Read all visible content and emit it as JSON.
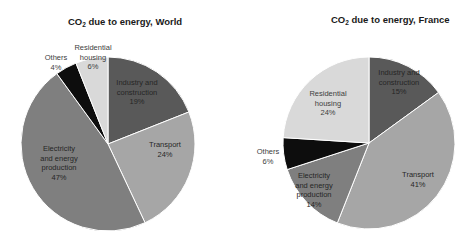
{
  "chart_data": [
    {
      "type": "pie",
      "title": "CO2 due to energy, World",
      "title_parts": {
        "prefix": "CO",
        "subscript": "2",
        "suffix": " due to energy, World"
      },
      "categories": [
        "Industry and construction",
        "Transport",
        "Electricity and energy production",
        "Others",
        "Residential housing"
      ],
      "values": [
        19,
        24,
        47,
        4,
        6
      ],
      "unit": "%",
      "start_angle": "12 o'clock",
      "direction": "clockwise",
      "colors": [
        "#595959",
        "#a6a6a6",
        "#7f7f7f",
        "#0d0d0d",
        "#d9d9d9"
      ],
      "labels": [
        {
          "lines": [
            "Industry and",
            "construction",
            "19%"
          ],
          "x": 137,
          "y": 92,
          "color": "#262626"
        },
        {
          "lines": [
            "Transport",
            "24%"
          ],
          "x": 165,
          "y": 149,
          "color": "#262626"
        },
        {
          "lines": [
            "Electricity",
            "and energy",
            "production",
            "47%"
          ],
          "x": 59,
          "y": 163,
          "color": "#262626"
        },
        {
          "lines": [
            "Others",
            "4%"
          ],
          "x": 56,
          "y": 62,
          "color": "#404040",
          "outside": true
        },
        {
          "lines": [
            "Residential",
            "housing",
            "6%"
          ],
          "x": 93,
          "y": 57,
          "color": "#404040",
          "outside": true
        }
      ],
      "legend": "none"
    },
    {
      "type": "pie",
      "title": "CO2 due to energy, France",
      "title_parts": {
        "prefix": "CO",
        "subscript": "2",
        "suffix": " due to energy, France"
      },
      "categories": [
        "Industry and construction",
        "Transport",
        "Electricity and energy production",
        "Others",
        "Residential housing"
      ],
      "values": [
        15,
        41,
        14,
        6,
        24
      ],
      "unit": "%",
      "start_angle": "12 o'clock",
      "direction": "clockwise",
      "colors": [
        "#595959",
        "#a6a6a6",
        "#7f7f7f",
        "#0d0d0d",
        "#d9d9d9"
      ],
      "labels": [
        {
          "lines": [
            "Industry and",
            "construction",
            "15%"
          ],
          "x": 399,
          "y": 82,
          "color": "#262626"
        },
        {
          "lines": [
            "Transport",
            "41%"
          ],
          "x": 418,
          "y": 179,
          "color": "#262626"
        },
        {
          "lines": [
            "Electricity",
            "and energy",
            "production",
            "14%"
          ],
          "x": 314,
          "y": 190,
          "color": "#262626"
        },
        {
          "lines": [
            "Others",
            "6%"
          ],
          "x": 268,
          "y": 156,
          "color": "#404040",
          "outside": true
        },
        {
          "lines": [
            "Residential",
            "housing",
            "24%"
          ],
          "x": 328,
          "y": 103,
          "color": "#404040",
          "outside": false
        }
      ],
      "legend": "none"
    }
  ],
  "charts": [
    {
      "title": {
        "prefix": "CO",
        "sub": "2",
        "suffix": " due to energy, World"
      }
    },
    {
      "title": {
        "prefix": "CO",
        "sub": "2",
        "suffix": " due to energy, France"
      }
    }
  ]
}
